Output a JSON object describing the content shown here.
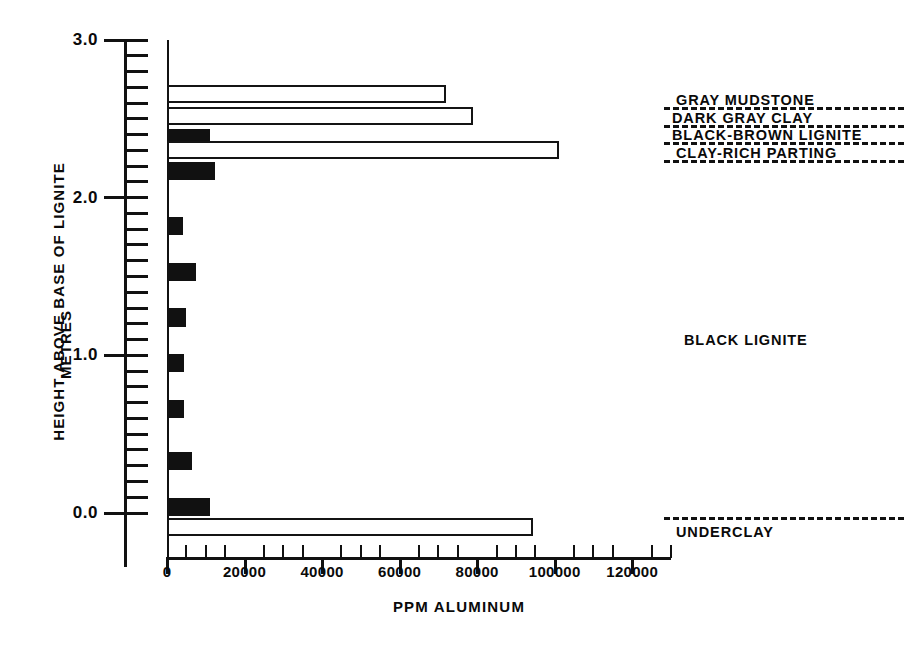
{
  "chart_data": {
    "type": "bar",
    "orientation": "horizontal",
    "title": "",
    "xlabel": "PPM ALUMINUM",
    "ylabel": "HEIGHT ABOVE BASE OF LIGNITE",
    "ylabel_units": "METRES",
    "xlim": [
      0,
      130000
    ],
    "ylim": [
      -0.2,
      3.0
    ],
    "grid": false,
    "legend": "none",
    "xticks": [
      0,
      20000,
      40000,
      60000,
      80000,
      100000,
      120000
    ],
    "xtick_labels": [
      "0",
      "20000",
      "40000",
      "60000",
      "80000",
      "100000",
      "120000"
    ],
    "xtick_minor_step": 5000,
    "yticks": [
      0.0,
      1.0,
      2.0,
      3.0
    ],
    "ytick_labels": [
      "0.0",
      "1.0",
      "2.0",
      "3.0"
    ],
    "ytick_minor_step": 0.1,
    "bar_fill_legend": {
      "hollow": "non-lignite lithology sample",
      "filled": "lignite sample"
    },
    "samples": [
      {
        "height_m": 2.66,
        "ppm_aluminum": 72000,
        "fill": "hollow",
        "unit": "GRAY MUDSTONE"
      },
      {
        "height_m": 2.52,
        "ppm_aluminum": 79000,
        "fill": "hollow",
        "unit": "DARK GRAY CLAY"
      },
      {
        "height_m": 2.38,
        "ppm_aluminum": 11000,
        "fill": "filled",
        "unit": "BLACK-BROWN LIGNITE"
      },
      {
        "height_m": 2.3,
        "ppm_aluminum": 101000,
        "fill": "hollow",
        "unit": "CLAY-RICH PARTING"
      },
      {
        "height_m": 2.17,
        "ppm_aluminum": 12500,
        "fill": "filled",
        "unit": "BLACK LIGNITE"
      },
      {
        "height_m": 1.82,
        "ppm_aluminum": 4000,
        "fill": "filled",
        "unit": "BLACK LIGNITE"
      },
      {
        "height_m": 1.53,
        "ppm_aluminum": 7500,
        "fill": "filled",
        "unit": "BLACK LIGNITE"
      },
      {
        "height_m": 1.24,
        "ppm_aluminum": 5000,
        "fill": "filled",
        "unit": "BLACK LIGNITE"
      },
      {
        "height_m": 0.95,
        "ppm_aluminum": 4500,
        "fill": "filled",
        "unit": "BLACK LIGNITE"
      },
      {
        "height_m": 0.66,
        "ppm_aluminum": 4500,
        "fill": "filled",
        "unit": "BLACK LIGNITE"
      },
      {
        "height_m": 0.33,
        "ppm_aluminum": 6500,
        "fill": "filled",
        "unit": "BLACK LIGNITE"
      },
      {
        "height_m": 0.04,
        "ppm_aluminum": 11000,
        "fill": "filled",
        "unit": "BLACK LIGNITE"
      },
      {
        "height_m": -0.09,
        "ppm_aluminum": 94500,
        "fill": "hollow",
        "unit": "UNDERCLAY"
      }
    ],
    "stratigraphic_units": [
      {
        "name": "GRAY MUDSTONE",
        "boundary_height_m": 2.6
      },
      {
        "name": "DARK GRAY CLAY",
        "boundary_height_m": 2.46
      },
      {
        "name": "BLACK-BROWN LIGNITE",
        "boundary_height_m": 2.33
      },
      {
        "name": "CLAY-RICH PARTING",
        "boundary_height_m": 2.21
      },
      {
        "name": "BLACK LIGNITE",
        "boundary_height_m": null
      },
      {
        "name": "UNDERCLAY",
        "boundary_height_m": -0.02
      }
    ]
  },
  "colors": {
    "ink": "#111111",
    "paper": "#ffffff",
    "bar_fill": "#111111",
    "bar_hollow": "#ffffff"
  }
}
